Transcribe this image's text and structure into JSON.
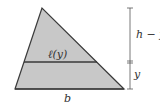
{
  "diagram": {
    "labels": {
      "cross_section": "ℓ(y)",
      "upper_height": "h − y",
      "lower_height": "y",
      "base": "b"
    },
    "colors": {
      "fill": "#c8c8c8",
      "stroke": "#3a3a3a",
      "dimension_line": "#555555",
      "background": "#ffffff"
    },
    "geometry": {
      "apex": [
        42,
        8
      ],
      "base_left": [
        15,
        89
      ],
      "base_right": [
        124,
        89
      ],
      "cross_section_y": 62,
      "dimension_x": 130
    }
  }
}
